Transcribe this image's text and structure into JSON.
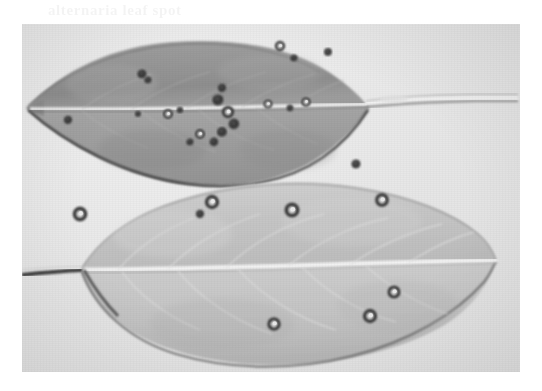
{
  "page": {
    "background_color": "#ffffff",
    "width": 542,
    "height": 391,
    "bleed_through_text": "alternaria leaf spot",
    "bleed_through_text_secondary": "leaf spot disease"
  },
  "photograph": {
    "caption": "",
    "type": "grayscale scanned photograph",
    "subject": "two plant leaves showing necrotic leaf-spot lesions",
    "frame": {
      "x": 22,
      "y": 24,
      "width": 498,
      "height": 348
    },
    "background_color": "#e8e8e8",
    "colors": {
      "page_white": "#ffffff",
      "photo_background": "#e8e8e8",
      "upper_leaf_fill": "#9a9a9a",
      "lower_leaf_fill": "#c8c8c8",
      "midrib_light": "#efefef",
      "lesion_dark": "#2e2e2e",
      "lesion_center_light": "#ededed",
      "leaf_outline": "#3a3a3a"
    },
    "leaves": [
      {
        "name": "upper-leaf",
        "tone": "dark gray",
        "orientation": "tip pointing left, petiole extending right",
        "lesion_count": 19,
        "lesion_description": "numerous small dark coalescing necrotic spots concentrated above and along the midrib"
      },
      {
        "name": "lower-leaf",
        "tone": "light gray",
        "orientation": "tip pointing right, petiole extending left",
        "lesion_count": 10,
        "lesion_description": "fewer larger target-like lesions with dark margins and pale necrotic centers"
      }
    ],
    "upper_leaf_lesions": [
      {
        "cx": 46,
        "cy": 96,
        "r": 4.2,
        "style": "solid"
      },
      {
        "cx": 120,
        "cy": 50,
        "r": 4.6,
        "style": "solid"
      },
      {
        "cx": 126,
        "cy": 56,
        "r": 3.6,
        "style": "solid"
      },
      {
        "cx": 146,
        "cy": 90,
        "r": 5.0,
        "style": "ring"
      },
      {
        "cx": 158,
        "cy": 86,
        "r": 3.2,
        "style": "solid"
      },
      {
        "cx": 196,
        "cy": 76,
        "r": 5.6,
        "style": "solid"
      },
      {
        "cx": 200,
        "cy": 64,
        "r": 4.2,
        "style": "solid"
      },
      {
        "cx": 206,
        "cy": 88,
        "r": 6.2,
        "style": "ring"
      },
      {
        "cx": 212,
        "cy": 100,
        "r": 5.4,
        "style": "solid"
      },
      {
        "cx": 200,
        "cy": 108,
        "r": 5.0,
        "style": "solid"
      },
      {
        "cx": 192,
        "cy": 118,
        "r": 4.4,
        "style": "solid"
      },
      {
        "cx": 178,
        "cy": 110,
        "r": 5.0,
        "style": "ring"
      },
      {
        "cx": 168,
        "cy": 118,
        "r": 3.6,
        "style": "solid"
      },
      {
        "cx": 246,
        "cy": 80,
        "r": 4.6,
        "style": "ring"
      },
      {
        "cx": 268,
        "cy": 84,
        "r": 3.4,
        "style": "solid"
      },
      {
        "cx": 284,
        "cy": 78,
        "r": 4.8,
        "style": "ring"
      },
      {
        "cx": 258,
        "cy": 22,
        "r": 5.2,
        "style": "ring"
      },
      {
        "cx": 272,
        "cy": 34,
        "r": 3.6,
        "style": "solid"
      },
      {
        "cx": 306,
        "cy": 28,
        "r": 4.0,
        "style": "solid"
      }
    ],
    "lower_leaf_lesions": [
      {
        "cx": 116,
        "cy": 90,
        "r": 3.0,
        "style": "solid"
      },
      {
        "cx": 58,
        "cy": 190,
        "r": 7.4,
        "style": "ring"
      },
      {
        "cx": 190,
        "cy": 178,
        "r": 7.2,
        "style": "ring"
      },
      {
        "cx": 178,
        "cy": 190,
        "r": 4.2,
        "style": "solid"
      },
      {
        "cx": 270,
        "cy": 186,
        "r": 7.6,
        "style": "ring"
      },
      {
        "cx": 360,
        "cy": 176,
        "r": 7.0,
        "style": "ring"
      },
      {
        "cx": 334,
        "cy": 140,
        "r": 4.6,
        "style": "solid"
      },
      {
        "cx": 372,
        "cy": 268,
        "r": 6.6,
        "style": "ring"
      },
      {
        "cx": 252,
        "cy": 300,
        "r": 6.8,
        "style": "ring"
      },
      {
        "cx": 348,
        "cy": 292,
        "r": 7.2,
        "style": "ring"
      }
    ]
  }
}
